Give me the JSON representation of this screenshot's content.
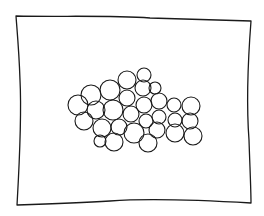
{
  "drawing": {
    "description": "Hand-drawn sketch: wavy rectangular frame containing a cluster of overlapping circles",
    "stroke_color": "#1a1a1a",
    "background": "#ffffff",
    "frame": {
      "path": "M16 16 C 60 17, 110 15, 150 18 C 190 19, 220 20, 251 21 C 248 60, 246 100, 249 140 C 250 170, 251 190, 251 203 C 200 200, 150 198, 110 201 C 80 203, 50 204, 17 205 C 19 170, 22 120, 20 80 C 19 50, 17 30, 16 16 Z"
    },
    "circles": [
      {
        "cx": 78,
        "cy": 105,
        "r": 10
      },
      {
        "cx": 91,
        "cy": 95,
        "r": 10
      },
      {
        "cx": 84,
        "cy": 121,
        "r": 9
      },
      {
        "cx": 96,
        "cy": 110,
        "r": 9
      },
      {
        "cx": 110,
        "cy": 90,
        "r": 10
      },
      {
        "cx": 113,
        "cy": 110,
        "r": 10
      },
      {
        "cx": 102,
        "cy": 128,
        "r": 9
      },
      {
        "cx": 100,
        "cy": 141,
        "r": 6
      },
      {
        "cx": 114,
        "cy": 142,
        "r": 9
      },
      {
        "cx": 119,
        "cy": 127,
        "r": 8
      },
      {
        "cx": 127,
        "cy": 80,
        "r": 9
      },
      {
        "cx": 127,
        "cy": 98,
        "r": 8
      },
      {
        "cx": 131,
        "cy": 114,
        "r": 8
      },
      {
        "cx": 134,
        "cy": 133,
        "r": 10
      },
      {
        "cx": 144,
        "cy": 75,
        "r": 7
      },
      {
        "cx": 143,
        "cy": 88,
        "r": 8
      },
      {
        "cx": 144,
        "cy": 105,
        "r": 8
      },
      {
        "cx": 155,
        "cy": 88,
        "r": 6
      },
      {
        "cx": 148,
        "cy": 143,
        "r": 9
      },
      {
        "cx": 146,
        "cy": 121,
        "r": 7
      },
      {
        "cx": 159,
        "cy": 101,
        "r": 8
      },
      {
        "cx": 159,
        "cy": 117,
        "r": 7
      },
      {
        "cx": 157,
        "cy": 130,
        "r": 8
      },
      {
        "cx": 174,
        "cy": 105,
        "r": 7
      },
      {
        "cx": 175,
        "cy": 120,
        "r": 7
      },
      {
        "cx": 175,
        "cy": 133,
        "r": 9
      },
      {
        "cx": 191,
        "cy": 106,
        "r": 9
      },
      {
        "cx": 190,
        "cy": 121,
        "r": 8
      },
      {
        "cx": 193,
        "cy": 136,
        "r": 9
      }
    ]
  }
}
